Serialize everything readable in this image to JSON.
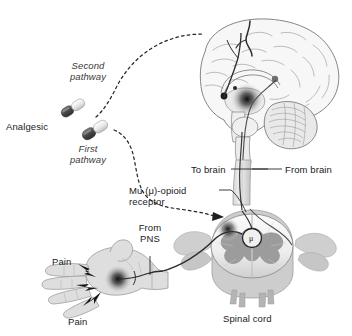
{
  "figure": {
    "background_color": "#ffffff",
    "width": 352,
    "height": 336
  },
  "labels": {
    "second_pathway_line1": "Second",
    "second_pathway_line2": "pathway",
    "analgesic": "Analgesic",
    "first_pathway_line1": "First",
    "first_pathway_line2": "pathway",
    "mu_receptor_line1": "Mu (μ)-opioid",
    "mu_receptor_line2": "receptor",
    "to_brain": "To brain",
    "from_brain": "From brain",
    "from_pns_line1": "From",
    "from_pns_line2": "PNS",
    "pain_upper": "Pain",
    "pain_lower": "Pain",
    "spinal_cord": "Spinal cord",
    "mu_symbol": "μ"
  },
  "colors": {
    "ink": "#1a1a1a",
    "italic_ink": "#3a3a3a",
    "outline": "#6e6e6e",
    "light_fill": "#f2f2f2",
    "mid_gray": "#b9b9b9",
    "dark_gray": "#8a8a8a",
    "gray_matter": "#9a9a9a",
    "capsule_dark": "#555555",
    "capsule_light": "#ececec",
    "receptor_spot": "#1f1f1f",
    "nerve": "#2b2b2b",
    "dashed": "#2a2a2a"
  },
  "anatomy": {
    "brain": "mid-sagittal section of cerebrum with cerebellum and brainstem",
    "spinal_cord": "transverse section with butterfly-shaped gray matter and nerve roots",
    "hand": "palmar view of left hand with pain source on palm",
    "capsules": 2,
    "receptor_spots": 3,
    "pain_bolts": 3
  }
}
